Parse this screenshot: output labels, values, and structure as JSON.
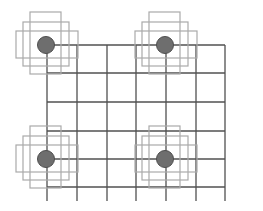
{
  "diagram": {
    "type": "grid-with-nodes",
    "grid": {
      "columns": 6,
      "rows": 5,
      "line_color": "#505050"
    },
    "nodes": [
      {
        "id": "node-top-left",
        "col": 0,
        "row": 0
      },
      {
        "id": "node-top-right",
        "col": 4,
        "row": 0
      },
      {
        "id": "node-bottom-left",
        "col": 0,
        "row": 4
      },
      {
        "id": "node-bottom-right",
        "col": 4,
        "row": 4
      }
    ],
    "node_fill": "#6e6e6e",
    "node_stroke": "#4e4e4e",
    "halo_color": "#aaaaaa"
  }
}
